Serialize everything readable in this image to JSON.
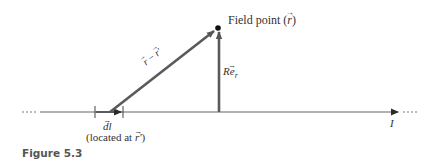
{
  "figure": {
    "caption": "Figure 5.3",
    "caption_color": "#555555",
    "line_color": "#5a5a5a",
    "dot_color": "#111111"
  },
  "labels": {
    "field_point_text": "Field point (",
    "field_point_var": "r",
    "field_point_close": ")",
    "diagonal_r": "r",
    "diagonal_minus": " − ",
    "diagonal_rprime": "r′",
    "vertical_R": "R",
    "vertical_e": "e",
    "vertical_sub": "r",
    "dl_d": "d",
    "dl_l": "l",
    "located_open": "(located at ",
    "located_var": "r′",
    "located_close": ")",
    "current": "I",
    "left_dots": "····",
    "right_dots": "····"
  },
  "geometry": {
    "axis_y": 112,
    "axis_x_start": 40,
    "axis_x_end": 400,
    "field_point": [
      218,
      28
    ],
    "dl_tick_left": 95,
    "dl_tick_right": 123,
    "diagonal_start": [
      110,
      112
    ]
  }
}
